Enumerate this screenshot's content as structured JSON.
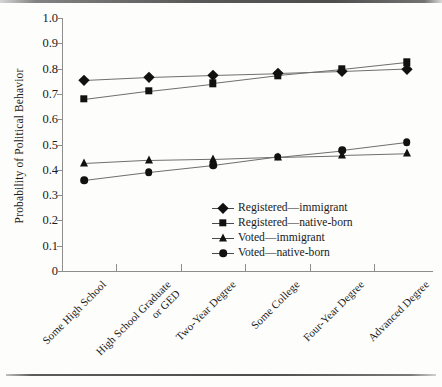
{
  "chart_data": {
    "type": "line",
    "title": "",
    "xlabel": "",
    "ylabel": "Probability of Political Behavior",
    "ylim": [
      0,
      1.0
    ],
    "ytick_labels": [
      "1.0",
      "0.9",
      "0.8",
      "0.7",
      "0.6",
      "0.5",
      "0.4",
      "0.3",
      "0.2",
      "0.1",
      "0"
    ],
    "ytick_values": [
      1.0,
      0.9,
      0.8,
      0.7,
      0.6,
      0.5,
      0.4,
      0.3,
      0.2,
      0.1,
      0
    ],
    "grid": false,
    "legend_position": "inside-lower-right",
    "categories": [
      "Some High School",
      "High School Graduate or GED",
      "Two-Year Degree",
      "Some College",
      "Four-Year Degree",
      "Advanced Degree"
    ],
    "category_lines": [
      [
        "Some High School"
      ],
      [
        "High School Graduate",
        "or GED"
      ],
      [
        "Two-Year Degree"
      ],
      [
        "Some College"
      ],
      [
        "Four-Year Degree"
      ],
      [
        "Advanced Degree"
      ]
    ],
    "series": [
      {
        "name": "Registered—immigrant",
        "marker": "diamond",
        "values": [
          0.755,
          0.767,
          0.775,
          0.782,
          0.79,
          0.8
        ]
      },
      {
        "name": "Registered—native-born",
        "marker": "square",
        "values": [
          0.68,
          0.713,
          0.742,
          0.773,
          0.797,
          0.825
        ]
      },
      {
        "name": "Voted—immigrant",
        "marker": "triangle",
        "values": [
          0.425,
          0.438,
          0.443,
          0.452,
          0.458,
          0.465
        ]
      },
      {
        "name": "Voted—native-born",
        "marker": "circle",
        "values": [
          0.358,
          0.39,
          0.418,
          0.452,
          0.478,
          0.51
        ]
      }
    ]
  },
  "colors": {
    "marker": "#111111",
    "line": "#6f6f6f",
    "axis": "#8e8e8e",
    "text": "#1a1a1a",
    "background": "#fdfdfc"
  }
}
